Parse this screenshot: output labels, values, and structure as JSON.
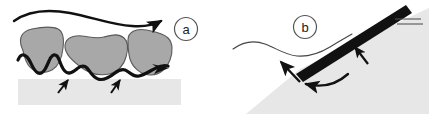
{
  "figure": {
    "type": "scientific-schematic-diagram",
    "width": 429,
    "height": 114,
    "background_color": "#ffffff",
    "panels": [
      {
        "id": "a",
        "label": "a",
        "label_style": "circled-letter",
        "description": "Rough undulating contact line beneath irregular gray blobs resting on a light gray substrate, with a long sweeping arrow above indicating direction of motion and two short upward arrows marking pinning points.",
        "elements": {
          "direction_arrow_label": "sweeping motion arrow (left to right)",
          "contact_line_label": "undulating contact line",
          "blob_count": 3,
          "pinning_arrow_count": 2,
          "substrate_label": "substrate band",
          "inline_arrow_label": "contact line advance arrow"
        }
      },
      {
        "id": "b",
        "label": "b",
        "label_style": "circled-letter",
        "description": "Thin wavy line meeting a thick dark diagonal bar above a light gray wedge, with a straight arrow and a curved arrow indicating pivoting motion at the contact point and a short arrow pointing at the bar.",
        "elements": {
          "wavy_line_label": "thin free surface line",
          "bar_label": "thick dark diagonal bar",
          "wedge_label": "light gray wedge region",
          "pivot_arrow_label": "pivot direction arrow",
          "curved_arrow_label": "rotation arrow",
          "pointer_arrow_label": "bar indicator arrow",
          "tick_line_count": 2
        }
      }
    ]
  },
  "colors": {
    "ink": "#111111",
    "blob_gray": "#a8a8a8",
    "blob_outline": "#4a4a4a",
    "substrate_gray": "#e7e7e7",
    "wedge_gray": "#e7e7e7",
    "thin_line": "#444444",
    "background": "#ffffff"
  }
}
